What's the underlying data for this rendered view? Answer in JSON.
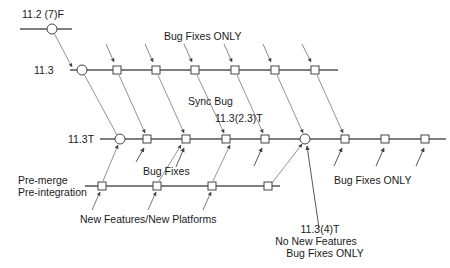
{
  "labels": {
    "release_11_2": "11.2 (7)F",
    "release_11_3": "11.3",
    "release_11_3t": "11.3T",
    "premerge_1": "Pre-merge",
    "premerge_2": "Pre-integration",
    "bug_fixes_only_top": "Bug Fixes ONLY",
    "sync_bug": "Sync Bug",
    "release_11_3_2_3t": "11.3(2.3)T",
    "bug_fixes": "Bug Fixes",
    "bug_fixes_only_right": "Bug Fixes ONLY",
    "new_features": "New Features/New Platforms",
    "release_11_3_4t_1": "11.3(4)T",
    "release_11_3_4t_2": "No New Features",
    "release_11_3_4t_3": "Bug Fixes ONLY"
  },
  "colors": {
    "line": "#555555",
    "node_fill": "#ffffff",
    "node_stroke": "#444444",
    "text": "#1a1a1a"
  },
  "trains": [
    {
      "name": "11.2",
      "y": 29,
      "x1": 20,
      "x2": 72,
      "circles": [
        52
      ],
      "squares": []
    },
    {
      "name": "11.3",
      "y": 70,
      "x1": 70,
      "x2": 338,
      "circles": [
        82
      ],
      "squares": [
        117,
        156,
        195,
        235,
        275,
        315
      ]
    },
    {
      "name": "11.3T",
      "y": 139,
      "x1": 100,
      "x2": 446,
      "circles": [
        120,
        305
      ],
      "squares": [
        147,
        186,
        226,
        265,
        345,
        385,
        425
      ]
    },
    {
      "name": "Pre-merge",
      "y": 186,
      "x1": 85,
      "x2": 280,
      "circles": [],
      "squares": [
        102,
        157,
        212,
        268
      ]
    }
  ]
}
